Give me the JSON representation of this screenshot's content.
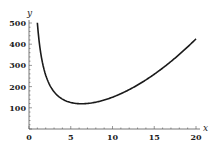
{
  "chart_data": {
    "type": "line",
    "title": "",
    "xlabel": "x",
    "ylabel": "y",
    "xlim": [
      0,
      20
    ],
    "ylim": [
      0,
      500
    ],
    "x_ticks": [
      0,
      5,
      10,
      15,
      20
    ],
    "y_ticks": [
      100,
      200,
      300,
      400,
      500
    ],
    "x_tick_labels": [
      "0",
      "5",
      "10",
      "15",
      "20"
    ],
    "y_tick_labels": [
      "100",
      "200",
      "300",
      "400",
      "500"
    ],
    "grid": false,
    "legend": null,
    "series": [
      {
        "name": "y = x^2 + 500/x",
        "x": [
          1,
          1.5,
          2,
          2.5,
          3,
          3.5,
          4,
          5,
          6,
          6.3,
          7,
          8,
          9,
          10,
          12,
          14,
          16,
          18,
          20
        ],
        "values": [
          501,
          335.6,
          254,
          206.3,
          175.7,
          155.1,
          141,
          125,
          119.3,
          119.1,
          120.4,
          126.5,
          136.6,
          150,
          185.7,
          231.7,
          287.3,
          351.8,
          425
        ],
        "color": "#1a1a1a"
      }
    ]
  }
}
